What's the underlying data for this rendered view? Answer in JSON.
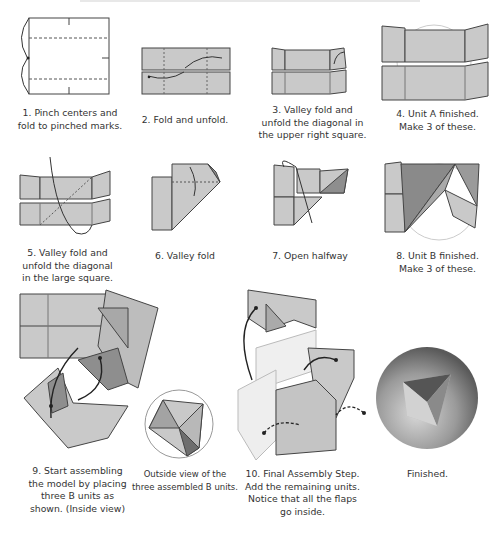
{
  "page": {
    "type": "origami instruction diagram page",
    "colors": {
      "paper": "#c8c8c8",
      "paper_dark": "#8e8e8e",
      "line": "#3a3a3a",
      "circle": "#d8d8d8",
      "text": "#333333"
    }
  },
  "steps": [
    {
      "id": 1,
      "caption": "1. Pinch centers and\nfold to pinched marks."
    },
    {
      "id": 2,
      "caption": "2. Fold and unfold."
    },
    {
      "id": 3,
      "caption": "3. Valley fold and\nunfold the diagonal in\nthe upper right square."
    },
    {
      "id": 4,
      "caption": "4. Unit A finished.\nMake 3 of these."
    },
    {
      "id": 5,
      "caption": "5. Valley fold and\nunfold the diagonal\nin the large square."
    },
    {
      "id": 6,
      "caption": "6. Valley fold"
    },
    {
      "id": 7,
      "caption": "7. Open halfway"
    },
    {
      "id": 8,
      "caption": "8. Unit B finished.\nMake 3 of these."
    },
    {
      "id": 9,
      "caption": "9. Start assembling\nthe model by placing\nthree B units as\nshown. (Inside view)"
    },
    {
      "id": "outside",
      "caption": "Outside view of the\nthree assembled B units."
    },
    {
      "id": 10,
      "caption": "10. Final Assembly Step.\nAdd the remaining units.\nNotice that all the flaps\ngo inside."
    },
    {
      "id": "finished",
      "caption": "Finished."
    }
  ]
}
